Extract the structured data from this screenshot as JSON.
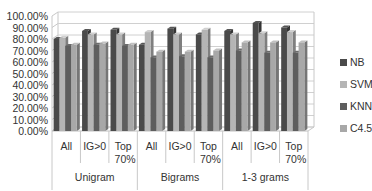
{
  "chart_data": {
    "type": "bar",
    "style": "3d-clustered-column",
    "title": "",
    "xlabel": "",
    "ylabel": "",
    "ylim": [
      0,
      100
    ],
    "y_ticks": [
      "0.00%",
      "10.00%",
      "20.00%",
      "30.00%",
      "40.00%",
      "50.00%",
      "60.00%",
      "70.00%",
      "80.00%",
      "90.00%",
      "100.00%"
    ],
    "grid": true,
    "legend_position": "right",
    "groups": [
      {
        "label": "Unigram",
        "categories": [
          "All",
          "IG>0",
          "Top 70%"
        ]
      },
      {
        "label": "Bigrams",
        "categories": [
          "All",
          "IG>0",
          "Top 70%"
        ]
      },
      {
        "label": "1-3 grams",
        "categories": [
          "All",
          "IG>0",
          "Top 70%"
        ]
      }
    ],
    "categories": [
      "Unigram All",
      "Unigram IG>0",
      "Unigram Top 70%",
      "Bigrams All",
      "Bigrams IG>0",
      "Bigrams Top 70%",
      "1-3 grams All",
      "1-3 grams IG>0",
      "1-3 grams Top 70%"
    ],
    "series": [
      {
        "name": "NB",
        "color": "#4a4a4a",
        "values": [
          80,
          87,
          88,
          75,
          89,
          84,
          87,
          94,
          90
        ]
      },
      {
        "name": "SVM",
        "color": "#b5b5b5",
        "values": [
          81,
          84,
          84,
          86,
          84,
          88,
          84,
          85,
          86
        ]
      },
      {
        "name": "KNN",
        "color": "#5e5e5e",
        "values": [
          74,
          75,
          74,
          64,
          65,
          64,
          70,
          68,
          68
        ]
      },
      {
        "name": "C4.5",
        "color": "#a8a8a8",
        "values": [
          75,
          76,
          75,
          69,
          69,
          70,
          77,
          77,
          77
        ]
      }
    ]
  },
  "legend": [
    {
      "label": "NB",
      "color": "#4a4a4a"
    },
    {
      "label": "SVM",
      "color": "#b5b5b5"
    },
    {
      "label": "KNN",
      "color": "#5e5e5e"
    },
    {
      "label": "C4.5",
      "color": "#a8a8a8"
    }
  ]
}
